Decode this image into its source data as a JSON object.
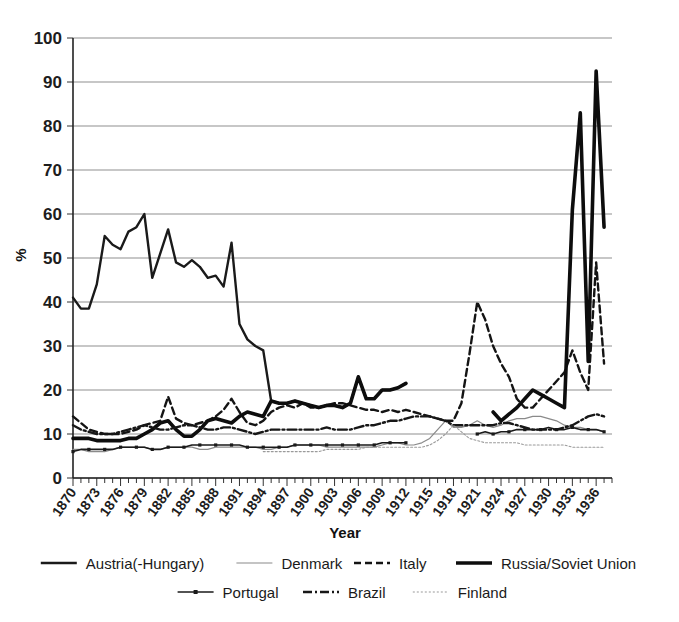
{
  "chart_data": {
    "type": "line",
    "title": "",
    "xlabel": "Year",
    "ylabel": "%",
    "ylim": [
      0,
      100
    ],
    "ytick_step": 10,
    "yticks": [
      "0",
      "10",
      "20",
      "30",
      "40",
      "50",
      "60",
      "70",
      "80",
      "90",
      "100"
    ],
    "xlim": [
      1870,
      1938
    ],
    "xtick_step": 3,
    "xticks": [
      "1870",
      "1873",
      "1876",
      "1879",
      "1882",
      "1885",
      "1888",
      "1891",
      "1894",
      "1897",
      "1900",
      "1903",
      "1906",
      "1909",
      "1912",
      "1915",
      "1918",
      "1921",
      "1924",
      "1927",
      "1930",
      "1933",
      "1936"
    ],
    "grid": "horizontal",
    "legend_position": "bottom",
    "series": [
      {
        "name": "Austria(-Hungary)",
        "style": "solid-thin",
        "color": "#1a1a1a",
        "x": [
          1870,
          1871,
          1872,
          1873,
          1874,
          1875,
          1876,
          1877,
          1878,
          1879,
          1880,
          1881,
          1882,
          1883,
          1884,
          1885,
          1886,
          1887,
          1888,
          1889,
          1890,
          1891,
          1892,
          1893,
          1894,
          1895,
          1896,
          1897,
          1898,
          1899,
          1900,
          1901,
          1902,
          1903,
          1904,
          1905,
          1906,
          1907,
          1908,
          1909,
          1910,
          1911,
          1912
        ],
        "values": [
          41,
          38.5,
          38.5,
          44,
          55,
          53,
          52,
          56,
          57,
          60,
          45.5,
          51,
          56.5,
          49,
          48,
          49.5,
          48,
          45.5,
          46,
          43.5,
          53.5,
          35,
          31.5,
          30,
          29,
          17.5,
          17,
          17,
          17.5,
          17,
          16.5,
          16,
          16.5,
          16.5,
          16,
          17,
          23,
          18,
          18,
          20,
          20,
          20.5,
          21.5
        ]
      },
      {
        "name": "Denmark",
        "style": "solid-light",
        "color": "#8a8a8a",
        "x": [
          1870,
          1871,
          1872,
          1873,
          1874,
          1875,
          1876,
          1877,
          1878,
          1879,
          1880,
          1881,
          1882,
          1883,
          1884,
          1885,
          1886,
          1887,
          1888,
          1889,
          1890,
          1891,
          1892,
          1893,
          1894,
          1895,
          1896,
          1897,
          1898,
          1899,
          1900,
          1901,
          1902,
          1903,
          1904,
          1905,
          1906,
          1907,
          1908,
          1909,
          1910,
          1911,
          1912,
          1913,
          1914,
          1915,
          1916,
          1917,
          1918,
          1919,
          1920,
          1921,
          1922,
          1923,
          1924,
          1925,
          1926,
          1927,
          1928,
          1929,
          1930,
          1931,
          1932,
          1933,
          1934,
          1935,
          1936,
          1937
        ],
        "values": [
          6.5,
          6.5,
          6,
          6,
          6,
          6.5,
          7,
          7,
          7,
          7,
          6.5,
          6.5,
          7,
          7,
          7,
          7,
          6.5,
          6.5,
          7,
          7,
          7,
          7,
          7,
          7,
          6.5,
          6.5,
          7,
          7,
          7.5,
          7.5,
          7.5,
          7.5,
          7,
          7,
          7,
          7,
          7,
          7,
          7,
          7.5,
          8,
          8,
          7.5,
          7.5,
          8,
          9,
          11,
          13,
          11.5,
          11.5,
          12,
          13,
          12,
          11.5,
          12,
          13,
          13.5,
          13.5,
          14,
          14,
          13.5,
          13,
          12,
          11.5,
          11.5,
          11,
          11,
          10.5
        ]
      },
      {
        "name": "Italy",
        "style": "dashed",
        "color": "#141414",
        "x": [
          1870,
          1871,
          1872,
          1873,
          1874,
          1875,
          1876,
          1877,
          1878,
          1879,
          1880,
          1881,
          1882,
          1883,
          1884,
          1885,
          1886,
          1887,
          1888,
          1889,
          1890,
          1891,
          1892,
          1893,
          1894,
          1895,
          1896,
          1897,
          1898,
          1899,
          1900,
          1901,
          1902,
          1903,
          1904,
          1905,
          1906,
          1907,
          1908,
          1909,
          1910,
          1911,
          1912,
          1913,
          1914,
          1915,
          1916,
          1917,
          1918,
          1919,
          1920,
          1921,
          1922,
          1923,
          1924,
          1925,
          1926,
          1927,
          1928,
          1929,
          1930,
          1931,
          1932,
          1933,
          1934,
          1935,
          1936,
          1937
        ],
        "values": [
          14,
          12.5,
          11,
          10.5,
          10,
          10,
          10,
          10.5,
          11,
          12,
          12.5,
          13,
          18.5,
          13.5,
          12.5,
          12,
          12.5,
          13,
          14,
          15.5,
          18,
          15,
          12.5,
          12,
          13,
          15,
          16,
          16.5,
          16,
          17,
          16,
          16,
          16.5,
          17,
          17,
          16.5,
          16,
          15.5,
          15.5,
          15,
          15.5,
          15,
          15.5,
          15,
          14.5,
          14,
          13.5,
          13,
          13,
          17,
          28,
          40,
          36,
          30,
          26,
          23,
          18,
          16,
          16,
          18,
          20,
          22,
          24,
          29,
          24,
          20,
          49,
          26
        ]
      },
      {
        "name": "Russia/Soviet Union",
        "style": "solid-thick",
        "color": "#0d0d0d",
        "x": [
          1870,
          1871,
          1872,
          1873,
          1874,
          1875,
          1876,
          1877,
          1878,
          1879,
          1880,
          1881,
          1882,
          1883,
          1884,
          1885,
          1886,
          1887,
          1888,
          1889,
          1890,
          1891,
          1892,
          1893,
          1894,
          1895,
          1896,
          1897,
          1898,
          1899,
          1900,
          1901,
          1902,
          1903,
          1904,
          1905,
          1906,
          1907,
          1908,
          1909,
          1910,
          1911,
          1912,
          1913,
          1914,
          1915,
          1916,
          1917,
          1918,
          1919,
          1920,
          1921,
          1922,
          1923,
          1924,
          1925,
          1926,
          1927,
          1928,
          1929,
          1930,
          1931,
          1932,
          1933,
          1934,
          1935,
          1936,
          1937
        ],
        "values": [
          9,
          9,
          9,
          8.5,
          8.5,
          8.5,
          8.5,
          9,
          9,
          10,
          11,
          12.5,
          13,
          11,
          9.5,
          9.5,
          11,
          13,
          13.5,
          13,
          12.5,
          14,
          15,
          14.5,
          14,
          17.5,
          17,
          17,
          17.5,
          17,
          16.5,
          16,
          16.5,
          16.5,
          16,
          17,
          23,
          18,
          18,
          20,
          20,
          20.5,
          21.5,
          null,
          null,
          null,
          null,
          null,
          null,
          null,
          null,
          null,
          null,
          15,
          13,
          14.5,
          16,
          18,
          20,
          19,
          18,
          17,
          16,
          61,
          83,
          26.5,
          92.5,
          57
        ]
      },
      {
        "name": "Portugal",
        "style": "marker-line",
        "color": "#1a1a1a",
        "x": [
          1870,
          1871,
          1872,
          1873,
          1874,
          1875,
          1876,
          1877,
          1878,
          1879,
          1880,
          1881,
          1882,
          1883,
          1884,
          1885,
          1886,
          1887,
          1888,
          1889,
          1890,
          1891,
          1892,
          1893,
          1894,
          1895,
          1896,
          1897,
          1898,
          1899,
          1900,
          1901,
          1902,
          1903,
          1904,
          1905,
          1906,
          1907,
          1908,
          1909,
          1910,
          1911,
          1912,
          1913,
          1914,
          1915,
          1916,
          1917,
          1918,
          1919,
          1920,
          1921,
          1922,
          1923,
          1924,
          1925,
          1926,
          1927,
          1928,
          1929,
          1930,
          1931,
          1932,
          1933,
          1934,
          1935,
          1936,
          1937
        ],
        "values": [
          6,
          6.5,
          6.5,
          6.5,
          6.5,
          6.5,
          7,
          7,
          7,
          7,
          6.5,
          6.5,
          7,
          7,
          7,
          7.5,
          7.5,
          7.5,
          7.5,
          7.5,
          7.5,
          7.5,
          7,
          7,
          7,
          7,
          7,
          7,
          7.5,
          7.5,
          7.5,
          7.5,
          7.5,
          7.5,
          7.5,
          7.5,
          7.5,
          7.5,
          7.5,
          8,
          8,
          8,
          8,
          null,
          null,
          null,
          null,
          null,
          null,
          null,
          null,
          10,
          10.5,
          10,
          10.5,
          10.5,
          11,
          11,
          11,
          11,
          11.5,
          11,
          11,
          11.5,
          11,
          11,
          11,
          10.5
        ]
      },
      {
        "name": "Brazil",
        "style": "dash-dot",
        "color": "#171717",
        "x": [
          1870,
          1871,
          1872,
          1873,
          1874,
          1875,
          1876,
          1877,
          1878,
          1879,
          1880,
          1881,
          1882,
          1883,
          1884,
          1885,
          1886,
          1887,
          1888,
          1889,
          1890,
          1891,
          1892,
          1893,
          1894,
          1895,
          1896,
          1897,
          1898,
          1899,
          1900,
          1901,
          1902,
          1903,
          1904,
          1905,
          1906,
          1907,
          1908,
          1909,
          1910,
          1911,
          1912,
          1913,
          1914,
          1915,
          1916,
          1917,
          1918,
          1919,
          1920,
          1921,
          1922,
          1923,
          1924,
          1925,
          1926,
          1927,
          1928,
          1929,
          1930,
          1931,
          1932,
          1933,
          1934,
          1935,
          1936,
          1937
        ],
        "values": [
          12,
          11,
          10.5,
          10,
          10,
          10,
          10.5,
          11,
          11.5,
          12,
          11.5,
          11,
          11,
          11.5,
          12,
          12,
          11.5,
          11,
          11,
          11.5,
          11.5,
          11,
          10.5,
          10,
          10.5,
          11,
          11,
          11,
          11,
          11,
          11,
          11,
          11.5,
          11,
          11,
          11,
          11.5,
          12,
          12,
          12.5,
          13,
          13,
          13.5,
          14,
          14,
          14,
          13.5,
          13,
          12,
          12,
          12,
          12,
          12,
          12,
          12.5,
          12.5,
          12,
          11.5,
          11,
          11,
          11,
          11,
          11.5,
          12,
          13,
          14,
          14.5,
          14
        ]
      },
      {
        "name": "Finland",
        "style": "dotted-light",
        "color": "#9a9a9a",
        "x": [
          1894,
          1895,
          1896,
          1897,
          1898,
          1899,
          1900,
          1901,
          1902,
          1903,
          1904,
          1905,
          1906,
          1907,
          1908,
          1909,
          1910,
          1911,
          1912,
          1913,
          1914,
          1915,
          1916,
          1917,
          1918,
          1919,
          1920,
          1921,
          1922,
          1923,
          1924,
          1925,
          1926,
          1927,
          1928,
          1929,
          1930,
          1931,
          1932,
          1933,
          1934,
          1935,
          1936,
          1937
        ],
        "values": [
          6,
          6,
          6,
          6,
          6,
          6,
          6,
          6,
          6.5,
          6.5,
          6.5,
          6.5,
          6.5,
          7,
          7,
          7,
          7,
          7,
          7,
          7,
          7,
          7.5,
          8.5,
          10,
          12,
          10.5,
          9,
          8.5,
          8,
          8,
          8,
          8,
          8,
          7.5,
          7.5,
          7.5,
          7.5,
          7.5,
          7.5,
          7,
          7,
          7,
          7,
          7
        ]
      }
    ]
  },
  "legend": {
    "row1": [
      {
        "label": "Austria(-Hungary)",
        "style": "solid-thin"
      },
      {
        "label": "Denmark",
        "style": "solid-light"
      },
      {
        "label": "Italy",
        "style": "dashed"
      },
      {
        "label": "Russia/Soviet Union",
        "style": "solid-thick"
      }
    ],
    "row2": [
      {
        "label": "Portugal",
        "style": "marker-line"
      },
      {
        "label": "Brazil",
        "style": "dash-dot"
      },
      {
        "label": "Finland",
        "style": "dotted-light"
      }
    ]
  },
  "colors": {
    "grid": "#8f8f8f",
    "axis": "#222222",
    "ink": "#1a1a1a",
    "light": "#8a8a8a"
  }
}
